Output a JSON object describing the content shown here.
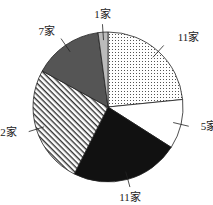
{
  "chart_data": {
    "type": "pie",
    "title": "",
    "unit": "家",
    "start": "top",
    "direction": "clockwise",
    "slices": [
      {
        "label": "11家",
        "value": 11,
        "fill": "dots"
      },
      {
        "label": "5家",
        "value": 5,
        "fill": "#ffffff"
      },
      {
        "label": "11家",
        "value": 11,
        "fill": "#111111"
      },
      {
        "label": "12家",
        "value": 12,
        "fill": "hatch"
      },
      {
        "label": "7家",
        "value": 7,
        "fill": "#555555"
      },
      {
        "label": "1家",
        "value": 1,
        "fill": "#bbbbbb"
      }
    ]
  }
}
